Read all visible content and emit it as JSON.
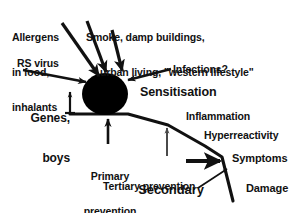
{
  "diagram": {
    "colors": {
      "ink": "#111111",
      "background": "#ffffff",
      "node_fill": "#000000",
      "thin_arrow": "#4a4a4a"
    },
    "central_node": {
      "name": "sensitisation-node",
      "shape": "filled-ellipse",
      "label": "Sensitisation"
    },
    "risk_factors": [
      {
        "id": "allergens",
        "lines": [
          "Allergens",
          "in food,",
          "inhalants"
        ],
        "arrow": "diagonal-down-right-to-node"
      },
      {
        "id": "smoke",
        "lines": [
          "Smoke, damp buildings,",
          "urban living, \"western lifestyle\""
        ],
        "arrow": "diagonal-down-left-to-node"
      },
      {
        "id": "rs-virus",
        "lines": [
          "RS virus"
        ],
        "arrow": "horizontal-right-to-node"
      },
      {
        "id": "infections",
        "lines": [
          "Infections?"
        ],
        "arrow": "diagonal-down-left-to-node"
      },
      {
        "id": "genes-boys",
        "lines": [
          "Genes,",
          "boys"
        ],
        "arrow": "short-vertical-up-barbed"
      }
    ],
    "outcome_cascade": [
      {
        "id": "inflammation",
        "label": "Inflammation"
      },
      {
        "id": "hyperreactivity",
        "label": "Hyperreactivity"
      },
      {
        "id": "symptoms",
        "label": "Symptoms"
      },
      {
        "id": "damage",
        "label": "Damage"
      }
    ],
    "prevention_points": [
      {
        "id": "primary-prevention",
        "lines": [
          "Primary",
          "prevention"
        ],
        "emphasis": "normal",
        "arrow": "thick-vertical-up"
      },
      {
        "id": "secondary-prevention",
        "lines": [
          "Secondary",
          "prevention"
        ],
        "emphasis": "large",
        "arrow": "thin-vertical-up-and-thick-horizontal-right"
      },
      {
        "id": "tertiary-prevention",
        "lines": [
          "Tertiary prevention"
        ],
        "emphasis": "normal",
        "arrow": "thin-diagonal-up-right"
      }
    ],
    "labels": {
      "allergens_l1": "Allergens",
      "allergens_l2": "in food,",
      "allergens_l3": "inhalants",
      "smoke_l1": "Smoke, damp buildings,",
      "smoke_l2": "urban living, \"western lifestyle\"",
      "rs_virus": "RS virus",
      "infections": "Infections?",
      "genes_l1": "Genes,",
      "genes_l2": "boys",
      "sensitisation": "Sensitisation",
      "inflammation": "Inflammation",
      "hyperreactivity": "Hyperreactivity",
      "symptoms": "Symptoms",
      "damage": "Damage",
      "primary_l1": "Primary",
      "primary_l2": "prevention",
      "secondary_l1": "Secondary",
      "secondary_l2": "prevention",
      "tertiary": "Tertiary prevention"
    }
  }
}
